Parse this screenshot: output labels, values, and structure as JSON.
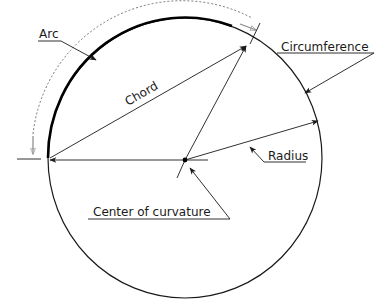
{
  "diagram": {
    "labels": {
      "arc": "Arc",
      "chord": "Chord",
      "circumference": "Circumference",
      "radius": "Radius",
      "center": "Center of curvature"
    },
    "colors": {
      "stroke": "#1a1a1a",
      "arc_highlight": "#000000",
      "dimension": "#777777",
      "background": "#ffffff"
    }
  }
}
